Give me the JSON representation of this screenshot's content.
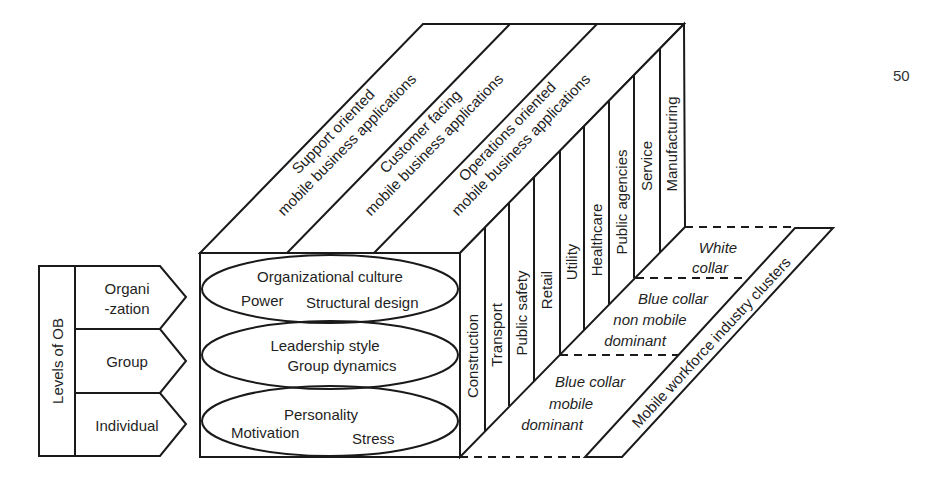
{
  "page_number": "50",
  "levels_of_ob": {
    "title": "Levels of OB",
    "levels": [
      {
        "label_line1": "Organi",
        "label_line2": "-zation"
      },
      {
        "label_line1": "Group",
        "label_line2": ""
      },
      {
        "label_line1": "Individual",
        "label_line2": ""
      }
    ]
  },
  "front_face": {
    "ellipses": [
      {
        "line1": "Organizational culture",
        "line2a": "Power",
        "line2b": "Structural design"
      },
      {
        "line1": "Leadership style",
        "line2": "Group dynamics"
      },
      {
        "line1": "Personality",
        "line2a": "Motivation",
        "line2b": "Stress"
      }
    ]
  },
  "top_face": {
    "applications": [
      {
        "line1": "Support oriented",
        "line2": "mobile business applications"
      },
      {
        "line1": "Customer facing",
        "line2": "mobile business applications"
      },
      {
        "line1": "Operations oriented",
        "line2": "mobile business applications"
      }
    ]
  },
  "side_face": {
    "industries": [
      "Construction",
      "Transport",
      "Public safety",
      "Retail",
      "Utility",
      "Healthcare",
      "Public agencies",
      "Service",
      "Manufacturing"
    ]
  },
  "floor": {
    "clusters": [
      {
        "line1": "White",
        "line2": "collar",
        "line3": ""
      },
      {
        "line1": "Blue collar",
        "line2": "non mobile",
        "line3": "dominant"
      },
      {
        "line1": "Blue collar",
        "line2": "mobile",
        "line3": "dominant"
      }
    ],
    "axis_label": "Mobile workforce industry clusters"
  }
}
